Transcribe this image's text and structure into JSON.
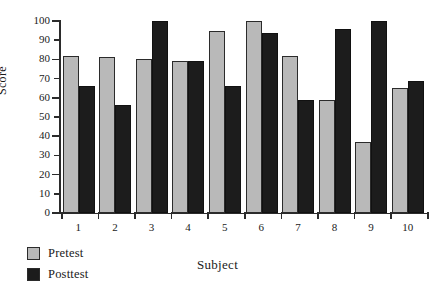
{
  "chart_data": {
    "type": "bar",
    "title": "",
    "xlabel": "Subject",
    "ylabel": "Score",
    "categories": [
      "1",
      "2",
      "3",
      "4",
      "5",
      "6",
      "7",
      "8",
      "9",
      "10"
    ],
    "series": [
      {
        "name": "Pretest",
        "color": "#b9b9b9",
        "values": [
          82,
          81,
          80,
          79,
          95,
          100,
          82,
          59,
          37,
          65
        ]
      },
      {
        "name": "Posttest",
        "color": "#1c1c1c",
        "values": [
          66,
          56,
          100,
          79,
          66,
          94,
          59,
          96,
          100,
          69
        ]
      }
    ],
    "ylim": [
      0,
      100
    ],
    "yticks": [
      0,
      10,
      20,
      30,
      40,
      50,
      60,
      70,
      80,
      90,
      100
    ],
    "ytick_labels": [
      "0",
      "10",
      "20",
      "30",
      "40",
      "50",
      "60",
      "70",
      "80",
      "90",
      "100"
    ],
    "grid": false,
    "legend_position": "bottom-left"
  },
  "legend": {
    "entries": [
      {
        "label": "Pretest"
      },
      {
        "label": "Posttest"
      }
    ]
  }
}
